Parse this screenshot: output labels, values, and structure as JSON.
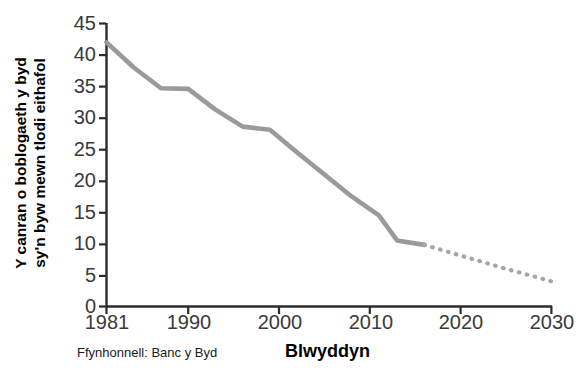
{
  "axes": {
    "y_axis_label_line1": "Y canran o boblogaeth y byd",
    "y_axis_label_line2": "sy'n byw mewn tlodi eithafol",
    "x_axis_label": "Blwyddyn",
    "source_note": "Ffynhonnell: Banc y Byd",
    "y_ticks": [
      "0",
      "5",
      "10",
      "15",
      "20",
      "25",
      "30",
      "35",
      "40",
      "45"
    ],
    "x_ticks": [
      "1981",
      "1990",
      "2000",
      "2010",
      "2020",
      "2030"
    ]
  },
  "colors": {
    "line": "#9a9a9a",
    "dotted_line": "#a6a6a6",
    "axis": "#2b2b2b",
    "tick_text": "#3a3a3a",
    "label_text": "#000000",
    "background": "#ffffff"
  },
  "chart_data": {
    "type": "line",
    "title": "",
    "subtitle": "",
    "xlabel": "Blwyddyn",
    "ylabel": "Y canran o boblogaeth y byd sy'n byw mewn tlodi eithafol",
    "source": "Ffynhonnell: Banc y Byd",
    "xlim": [
      1981,
      2030
    ],
    "ylim": [
      0,
      45
    ],
    "ytick_values": [
      0,
      5,
      10,
      15,
      20,
      25,
      30,
      35,
      40,
      45
    ],
    "xtick_values": [
      1981,
      1990,
      2000,
      2010,
      2020,
      2030
    ],
    "grid": false,
    "legend": "none",
    "series": [
      {
        "name": "Canran mewn tlodi eithafol (data)",
        "style": "solid",
        "color": "#9a9a9a",
        "x": [
          1981,
          1984,
          1987,
          1990,
          1993,
          1996,
          1999,
          2002,
          2005,
          2008,
          2011,
          2013,
          2016
        ],
        "values": [
          42.0,
          38.0,
          34.7,
          34.6,
          31.3,
          28.6,
          28.1,
          24.5,
          21.0,
          17.5,
          14.5,
          10.5,
          9.8
        ]
      },
      {
        "name": "Rhagamcan (dotiog)",
        "style": "dotted",
        "color": "#a6a6a6",
        "x": [
          2016,
          2020,
          2025,
          2030
        ],
        "values": [
          9.8,
          8.1,
          6.0,
          4.0
        ]
      }
    ]
  }
}
